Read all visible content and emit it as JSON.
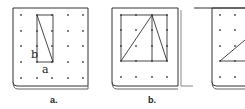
{
  "figure": {
    "panels": [
      {
        "id": "a",
        "label": "a.",
        "side_labels": {
          "vertical": "b",
          "horizontal": "a"
        }
      },
      {
        "id": "b",
        "label": "b."
      },
      {
        "id": "c",
        "label": ""
      }
    ]
  },
  "colors": {
    "line": "#333333",
    "dot": "#444444",
    "board_shadow": "#888888"
  }
}
